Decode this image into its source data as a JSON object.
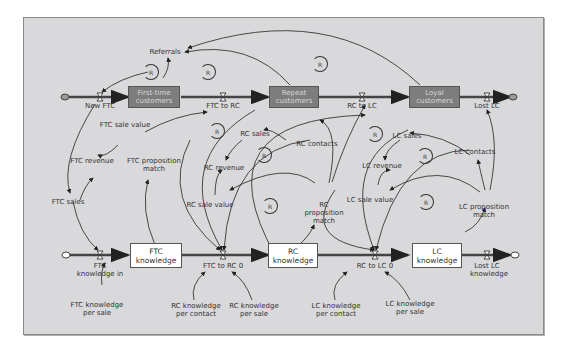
{
  "diagram": {
    "type": "stock-and-flow",
    "stocks_customers": [
      {
        "id": "ftc",
        "label": "First-time customers"
      },
      {
        "id": "rc",
        "label": "Repeat customers"
      },
      {
        "id": "lc",
        "label": "Loyal customers"
      }
    ],
    "stocks_knowledge": [
      {
        "id": "ftck",
        "label": "FTC knowledge"
      },
      {
        "id": "rck",
        "label": "RC knowledge"
      },
      {
        "id": "lck",
        "label": "LC knowledge"
      }
    ],
    "flows": {
      "new_ftc": "New FTC",
      "ftc_to_rc": "FTC to RC",
      "rc_to_lc": "RC to LC",
      "lost_lc": "Lost LC",
      "ftc_knowledge_in": "FTC knowledge in",
      "ftc_to_rc_0": "FTC to RC 0",
      "rc_to_lc_0": "RC to LC 0",
      "lost_lc_knowledge": "Lost LC knowledge"
    },
    "variables": {
      "referrals": "Referrals",
      "ftc_sale_value": "FTC sale value",
      "ftc_revenue": "FTC revenue",
      "ftc_sales": "FTC sales",
      "ftc_proposition_match": "FTC proposition match",
      "rc_sales": "RC sales",
      "rc_revenue": "RC revenue",
      "rc_sale_value": "RC sale value",
      "rc_contacts": "RC contacts",
      "rc_proposition_match": "RC proposition match",
      "lc_sales": "LC sales",
      "lc_revenue": "LC revenue",
      "lc_sale_value": "LC sale value",
      "lc_contacts": "LC contacts",
      "lc_proposition_match": "LC proposition match",
      "ftc_knowledge_per_sale": "FTC knowledge per sale",
      "rc_knowledge_per_contact": "RC knowledge per contact",
      "rc_knowledge_per_sale": "RC knowledge per sale",
      "lc_knowledge_per_contact": "LC knowledge per contact",
      "lc_knowledge_per_sale": "LC knowledge per sale"
    },
    "loop_marker": "R",
    "polarity": {
      "plus": "+",
      "minus": "-"
    }
  }
}
